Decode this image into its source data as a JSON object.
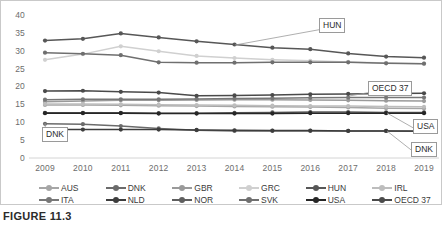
{
  "figure": {
    "caption": "FIGURE 11.3"
  },
  "chart_data": {
    "type": "line",
    "title": "",
    "xlabel": "",
    "ylabel": "",
    "grid": false,
    "legend_position": "bottom",
    "ylim": [
      0,
      40
    ],
    "yticks": [
      0,
      5,
      10,
      15,
      20,
      25,
      30,
      35,
      40
    ],
    "categories": [
      "2009",
      "2010",
      "2011",
      "2012",
      "2013",
      "2014",
      "2015",
      "2016",
      "2017",
      "2018",
      "2019"
    ],
    "series": [
      {
        "name": "AUS",
        "color": "#a6a6a6",
        "values": [
          14.9,
          14.9,
          14.8,
          14.7,
          14.6,
          14.5,
          14.4,
          14.3,
          14.2,
          14.0,
          13.9
        ]
      },
      {
        "name": "DNK",
        "color": "#6b6b6b",
        "values": [
          9.6,
          9.5,
          9.0,
          8.3,
          7.8,
          7.6,
          7.6,
          7.6,
          7.6,
          7.6,
          7.6
        ]
      },
      {
        "name": "GBR",
        "color": "#9a9a9a",
        "values": [
          15.8,
          16.0,
          16.2,
          16.2,
          16.3,
          16.4,
          16.4,
          16.3,
          16.2,
          16.1,
          16.0
        ]
      },
      {
        "name": "GRC",
        "color": "#d0d0d0",
        "values": [
          27.6,
          29.2,
          31.4,
          30.0,
          28.7,
          28.1,
          27.6,
          27.3,
          27.0,
          26.7,
          26.5
        ]
      },
      {
        "name": "HUN",
        "color": "#575757",
        "values": [
          33.0,
          33.5,
          35.0,
          33.9,
          32.8,
          31.9,
          31.0,
          30.6,
          29.4,
          28.5,
          28.2
        ]
      },
      {
        "name": "IRL",
        "color": "#bdbdbd",
        "values": [
          15.2,
          15.2,
          15.1,
          15.0,
          14.9,
          14.8,
          14.7,
          14.6,
          14.6,
          14.5,
          14.4
        ]
      },
      {
        "name": "ITA",
        "color": "#777777",
        "values": [
          16.4,
          16.5,
          16.5,
          16.5,
          16.6,
          16.7,
          16.8,
          16.9,
          17.0,
          17.0,
          17.0
        ]
      },
      {
        "name": "NLD",
        "color": "#3d3d3d",
        "values": [
          8.0,
          8.0,
          8.0,
          8.0,
          7.9,
          7.8,
          7.7,
          7.7,
          7.6,
          7.6,
          7.5
        ]
      },
      {
        "name": "NOR",
        "color": "#5e5e5e",
        "values": [
          12.7,
          12.7,
          12.7,
          12.6,
          12.6,
          12.7,
          12.8,
          12.9,
          12.9,
          12.8,
          12.8
        ]
      },
      {
        "name": "SVK",
        "color": "#6f6f6f",
        "values": [
          29.6,
          29.3,
          28.9,
          26.9,
          26.8,
          26.8,
          26.9,
          26.9,
          26.9,
          26.6,
          26.5
        ]
      },
      {
        "name": "USA",
        "color": "#262626",
        "values": [
          12.6,
          12.6,
          12.6,
          12.5,
          12.5,
          12.5,
          12.5,
          12.6,
          12.6,
          12.6,
          12.6
        ]
      },
      {
        "name": "OECD 37",
        "color": "#4a4a4a",
        "values": [
          18.8,
          18.9,
          18.6,
          18.4,
          17.5,
          17.6,
          17.7,
          17.9,
          18.0,
          18.1,
          18.2
        ]
      }
    ],
    "annotations": [
      {
        "label": "HUN",
        "box_x": 318,
        "box_y": 17,
        "anchor_x": 234,
        "anchor_y": 44
      },
      {
        "label": "OECD 37",
        "box_x": 367,
        "box_y": 80,
        "anchor_x": 348,
        "anchor_y": 95
      },
      {
        "label": "USA",
        "box_x": 412,
        "box_y": 118,
        "anchor_x": 386,
        "anchor_y": 112
      },
      {
        "label": "DNK",
        "box_x": 410,
        "box_y": 141,
        "anchor_x": 386,
        "anchor_y": 130
      },
      {
        "label": "DNK",
        "box_x": 41,
        "box_y": 126,
        "anchor_x": 44,
        "anchor_y": 122
      }
    ]
  }
}
